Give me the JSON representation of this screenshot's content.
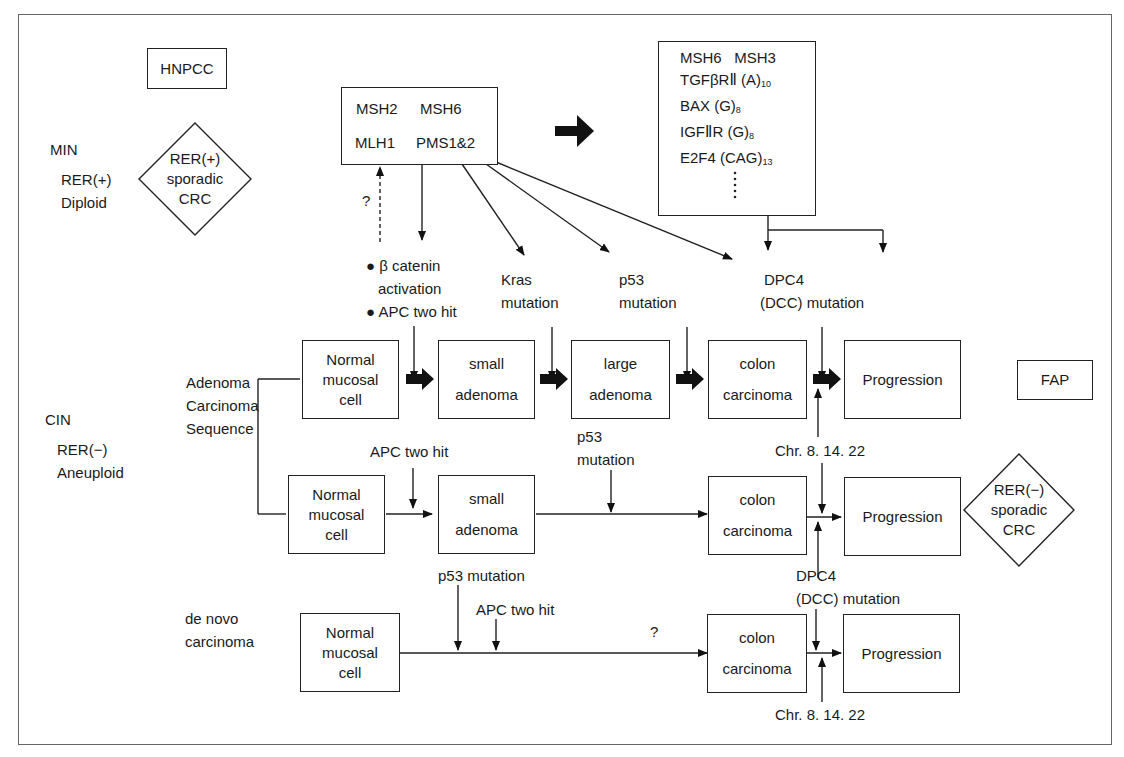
{
  "left_labels": {
    "min": {
      "title": "MIN",
      "line1": "RER(+)",
      "line2": "Diploid"
    },
    "cin": {
      "title": "CIN",
      "line1": "RER(−)",
      "line2": "Aneuploid"
    },
    "sequence": {
      "line1": "Adenoma",
      "line2": "Carcinoma",
      "line3": "Sequence"
    },
    "de_novo": {
      "line1": "de novo",
      "line2": "carcinoma"
    }
  },
  "hnpcc": {
    "label": "HNPCC"
  },
  "fap": {
    "label": "FAP"
  },
  "diamond_pos": {
    "line1": "RER(+)",
    "line2": "sporadic",
    "line3": "CRC"
  },
  "diamond_neg": {
    "line1": "RER(−)",
    "line2": "sporadic",
    "line3": "CRC"
  },
  "mmr_box": {
    "row1a": "MSH2",
    "row1b": "MSH6",
    "row2a": "MLH1",
    "row2b": "PMS1&2"
  },
  "target_genes": {
    "row1a": "MSH6",
    "row1b": "MSH3",
    "items": [
      {
        "name": "TGFβRⅡ (A)",
        "sub": "10"
      },
      {
        "name": "BAX (G)",
        "sub": "8"
      },
      {
        "name": "IGFⅡR (G)",
        "sub": "8"
      },
      {
        "name": "E2F4 (CAG)",
        "sub": "13"
      }
    ]
  },
  "question_mark": "?",
  "mutations_top": {
    "beta_catenin_1": "● β catenin",
    "beta_catenin_2": "activation",
    "apc": "● APC two hit",
    "kras_1": "Kras",
    "kras_2": "mutation",
    "p53_1": "p53",
    "p53_2": "mutation",
    "dpc4_1": "DPC4",
    "dpc4_2": "(DCC) mutation"
  },
  "row1": {
    "normal": {
      "line1": "Normal",
      "line2": "mucosal",
      "line3": "cell"
    },
    "small": {
      "line1": "small",
      "line2": "adenoma"
    },
    "large": {
      "line1": "large",
      "line2": "adenoma"
    },
    "colon": {
      "line1": "colon",
      "line2": "carcinoma"
    },
    "progression": "Progression"
  },
  "row2": {
    "apc": "APC two hit",
    "p53_1": "p53",
    "p53_2": "mutation",
    "chr": "Chr. 8. 14. 22",
    "normal": {
      "line1": "Normal",
      "line2": "mucosal",
      "line3": "cell"
    },
    "small": {
      "line1": "small",
      "line2": "adenoma"
    },
    "colon": {
      "line1": "colon",
      "line2": "carcinoma"
    },
    "progression": "Progression"
  },
  "row3": {
    "p53": "p53 mutation",
    "apc": "APC two hit",
    "question": "?",
    "dpc4_1": "DPC4",
    "dpc4_2": "(DCC) mutation",
    "chr": "Chr. 8. 14. 22",
    "normal": {
      "line1": "Normal",
      "line2": "mucosal",
      "line3": "cell"
    },
    "colon": {
      "line1": "colon",
      "line2": "carcinoma"
    },
    "progression": "Progression"
  }
}
